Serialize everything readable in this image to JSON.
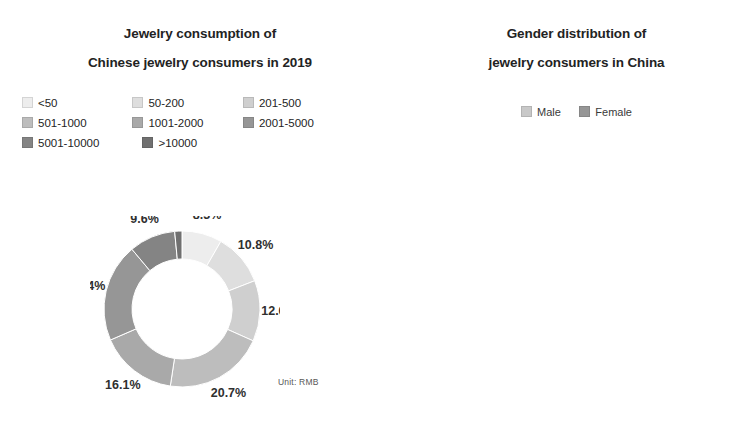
{
  "left_chart": {
    "title_line1": "Jewelry consumption of",
    "title_line2": "Chinese jewelry consumers in 2019",
    "unit_note": "Unit: RMB",
    "legend": [
      {
        "label": "<50",
        "color": "#ededed"
      },
      {
        "label": "50-200",
        "color": "#dedede"
      },
      {
        "label": "201-500",
        "color": "#cfcfcf"
      },
      {
        "label": "501-1000",
        "color": "#bdbdbd"
      },
      {
        "label": "1001-2000",
        "color": "#a9a9a9"
      },
      {
        "label": "2001-5000",
        "color": "#969696"
      },
      {
        "label": "5001-10000",
        "color": "#848484"
      },
      {
        "label": ">10000",
        "color": "#707070"
      }
    ],
    "labels": [
      "8.3%",
      "10.8%",
      "12.6%",
      "20.7%",
      "16.1%",
      "20.4%",
      "9.6%",
      "1.5%"
    ]
  },
  "right_chart": {
    "title_line1": "Gender distribution of",
    "title_line2": "jewelry consumers in China",
    "legend": [
      {
        "label": "Male",
        "color": "#c8c8c8"
      },
      {
        "label": "Female",
        "color": "#969696"
      }
    ],
    "labels": [
      "37.5%",
      "62.5%"
    ]
  },
  "chart_data": [
    {
      "type": "pie",
      "variant": "donut",
      "title": "Jewelry consumption of Chinese jewelry consumers in 2019",
      "unit": "Unit: RMB",
      "categories": [
        "<50",
        "50-200",
        "201-500",
        "501-1000",
        "1001-2000",
        "2001-5000",
        "5001-10000",
        ">10000"
      ],
      "values": [
        8.3,
        10.8,
        12.6,
        20.7,
        16.1,
        20.4,
        9.6,
        1.5
      ],
      "value_labels": [
        "8.3%",
        "10.8%",
        "12.6%",
        "20.7%",
        "16.1%",
        "20.4%",
        "9.6%",
        "1.5%"
      ],
      "colors": [
        "#ededed",
        "#dedede",
        "#cfcfcf",
        "#bdbdbd",
        "#a9a9a9",
        "#969696",
        "#848484",
        "#707070"
      ],
      "start_angle_deg": 0,
      "direction": "clockwise",
      "legend_position": "top",
      "grid": false,
      "xlabel": "",
      "ylabel": ""
    },
    {
      "type": "pie",
      "variant": "donut",
      "title": "Gender distribution of jewelry consumers in China",
      "categories": [
        "Male",
        "Female"
      ],
      "values": [
        37.5,
        62.5
      ],
      "value_labels": [
        "37.5%",
        "62.5%"
      ],
      "colors": [
        "#c8c8c8",
        "#969696"
      ],
      "start_angle_deg": 0,
      "direction": "clockwise",
      "legend_position": "top",
      "grid": false,
      "xlabel": "",
      "ylabel": ""
    }
  ]
}
